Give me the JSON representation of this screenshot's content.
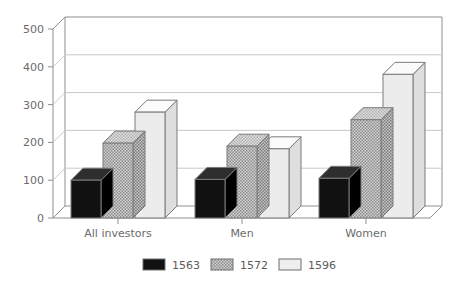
{
  "chart_data": {
    "type": "bar",
    "title": "",
    "subtitle": "",
    "xlabel": "",
    "ylabel": "",
    "categories": [
      "All investors",
      "Men",
      "Women"
    ],
    "series": [
      {
        "name": "1563",
        "values": [
          100,
          102,
          105
        ],
        "color": "#111111",
        "fill": "solid"
      },
      {
        "name": "1572",
        "values": [
          198,
          190,
          260
        ],
        "color": "#a8a8a8",
        "fill": "hatch"
      },
      {
        "name": "1596",
        "values": [
          280,
          183,
          380
        ],
        "color": "#e8e8e8",
        "fill": "light"
      }
    ],
    "ylim": [
      0,
      500
    ],
    "yticks": [
      "0",
      "100",
      "200",
      "300",
      "400",
      "500"
    ],
    "ytick_values": [
      0,
      100,
      200,
      300,
      400,
      500
    ],
    "grid": true,
    "legend_position": "bottom",
    "three_d": true
  },
  "legend": {
    "entries": [
      {
        "label": "1563"
      },
      {
        "label": "1572"
      },
      {
        "label": "1596"
      }
    ]
  },
  "axis": {
    "y_tick_0": "0",
    "y_tick_1": "100",
    "y_tick_2": "200",
    "y_tick_3": "300",
    "y_tick_4": "400",
    "y_tick_5": "500"
  },
  "colors": {
    "series_1563": "#111111",
    "series_1572": "#a8a8a8",
    "series_1596": "#e8e8e8",
    "grid": "#c9c9c9",
    "frame": "#8f8f8f",
    "text": "#6b6b6b",
    "background": "#ffffff"
  }
}
